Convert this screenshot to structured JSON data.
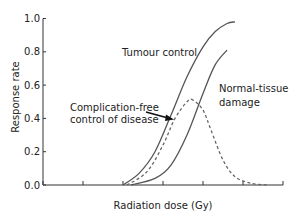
{
  "chart_data": {
    "type": "line",
    "title": "",
    "xlabel": "Radiation dose (Gy)",
    "ylabel": "Response rate",
    "xlim": [
      0,
      6
    ],
    "ylim": [
      0,
      1.0
    ],
    "x_ticks": [
      0,
      1,
      2,
      3,
      4,
      5,
      6
    ],
    "x_tick_labels": [
      "",
      "",
      "",
      "",
      "",
      "",
      ""
    ],
    "y_ticks": [
      0.0,
      0.2,
      0.4,
      0.6,
      0.8,
      1.0
    ],
    "y_tick_labels": [
      "0.0",
      "0.2",
      "0.4",
      "0.6",
      "0.8",
      "1.0"
    ],
    "grid": false,
    "legend": "none (inline annotations)",
    "series": [
      {
        "name": "Tumour control",
        "style": "solid",
        "color": "#555555",
        "points": [
          [
            2.0,
            0.0
          ],
          [
            2.4,
            0.07
          ],
          [
            2.8,
            0.2
          ],
          [
            3.2,
            0.42
          ],
          [
            3.6,
            0.65
          ],
          [
            4.0,
            0.83
          ],
          [
            4.3,
            0.92
          ],
          [
            4.6,
            0.97
          ],
          [
            4.8,
            0.98
          ]
        ]
      },
      {
        "name": "Normal-tissue damage",
        "style": "solid",
        "color": "#555555",
        "points": [
          [
            2.2,
            0.0
          ],
          [
            2.8,
            0.04
          ],
          [
            3.2,
            0.12
          ],
          [
            3.6,
            0.3
          ],
          [
            4.0,
            0.55
          ],
          [
            4.3,
            0.72
          ],
          [
            4.6,
            0.81
          ]
        ]
      },
      {
        "name": "Complication-free control of disease",
        "style": "dashed",
        "color": "#666666",
        "points": [
          [
            2.1,
            0.0
          ],
          [
            2.6,
            0.08
          ],
          [
            3.0,
            0.24
          ],
          [
            3.3,
            0.4
          ],
          [
            3.6,
            0.5
          ],
          [
            3.75,
            0.51
          ],
          [
            4.0,
            0.45
          ],
          [
            4.2,
            0.33
          ],
          [
            4.5,
            0.15
          ],
          [
            4.8,
            0.05
          ],
          [
            5.2,
            0.01
          ],
          [
            5.6,
            0.0
          ]
        ]
      }
    ],
    "annotations": [
      {
        "text": [
          "Tumour control"
        ],
        "x_px": 122,
        "y_px": 52
      },
      {
        "text": [
          "Normal-tissue",
          "damage"
        ],
        "x_px": 219,
        "y_px": 92
      },
      {
        "text": [
          "Complication-free",
          "control of disease"
        ],
        "x_px": 70,
        "y_px": 111,
        "arrow_to": [
          173,
          119
        ],
        "arrow_from": [
          146,
          112
        ]
      }
    ]
  },
  "labels": {
    "xlabel": "Radiation dose (Gy)",
    "ylabel": "Response rate",
    "tumour": "Tumour control",
    "normal_1": "Normal-tissue",
    "normal_2": "damage",
    "cf_1": "Complication-free",
    "cf_2": "control of disease"
  }
}
